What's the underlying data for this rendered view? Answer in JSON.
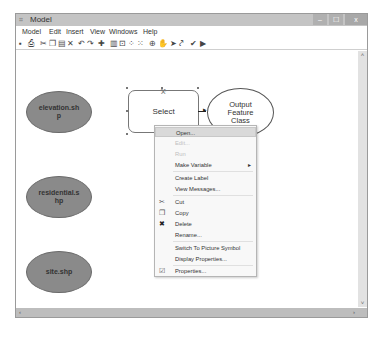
{
  "window": {
    "title": "Model",
    "app_icon": "⌗",
    "controls": {
      "minimize": "–",
      "maximize": "☐",
      "close": "x"
    }
  },
  "menubar": {
    "items": [
      {
        "label": "Model"
      },
      {
        "label": "Edit"
      },
      {
        "label": "Insert"
      },
      {
        "label": "View"
      },
      {
        "label": "Windows"
      },
      {
        "label": "Help"
      }
    ]
  },
  "toolbar": {
    "icons": [
      {
        "name": "save-icon",
        "glyph": "▪"
      },
      {
        "name": "print-icon",
        "glyph": "⎙"
      },
      {
        "name": "cut-icon",
        "glyph": "✂"
      },
      {
        "name": "copy-icon",
        "glyph": "❐"
      },
      {
        "name": "paste-icon",
        "glyph": "▤"
      },
      {
        "name": "delete-icon",
        "glyph": "✕"
      },
      {
        "name": "undo-icon",
        "glyph": "↶"
      },
      {
        "name": "redo-icon",
        "glyph": "↷"
      },
      {
        "name": "add-data-icon",
        "glyph": "✚"
      },
      {
        "name": "auto-layout-icon",
        "glyph": "▥"
      },
      {
        "name": "full-extent-icon",
        "glyph": "⊡"
      },
      {
        "name": "select-all-icon",
        "glyph": "⁘"
      },
      {
        "name": "select-elements-icon",
        "glyph": "⁙"
      },
      {
        "name": "zoom-in-icon",
        "glyph": "⊕"
      },
      {
        "name": "pan-icon",
        "glyph": "✋"
      },
      {
        "name": "select-pointer-icon",
        "glyph": "➤"
      },
      {
        "name": "add-connection-icon",
        "glyph": "⤤"
      },
      {
        "name": "validate-icon",
        "glyph": "✔"
      },
      {
        "name": "run-icon",
        "glyph": "▶"
      }
    ]
  },
  "diagram": {
    "inputs": [
      {
        "label": "elevation.sh\np"
      },
      {
        "label": "residential.s\nhp"
      },
      {
        "label": "site.shp"
      }
    ],
    "tool": {
      "label": "Select"
    },
    "output": {
      "label": "Output\nFeature\nClass"
    }
  },
  "context_menu": {
    "items": [
      {
        "label": "Open...",
        "enabled": true,
        "highlighted": true
      },
      {
        "label": "Edit...",
        "enabled": false
      },
      {
        "label": "Run",
        "enabled": false
      },
      {
        "label": "Make Variable",
        "enabled": true,
        "submenu": "▸"
      },
      {
        "label": "Create Label",
        "enabled": true
      },
      {
        "label": "View Messages...",
        "enabled": true
      },
      {
        "label": "Cut",
        "enabled": true,
        "icon": "✂"
      },
      {
        "label": "Copy",
        "enabled": true,
        "icon": "❐"
      },
      {
        "label": "Delete",
        "enabled": true,
        "icon": "✖"
      },
      {
        "label": "Rename...",
        "enabled": true
      },
      {
        "label": "Switch To Picture Symbol",
        "enabled": true
      },
      {
        "label": "Display Properties...",
        "enabled": true
      },
      {
        "label": "Properties...",
        "enabled": true,
        "icon": "☑"
      }
    ]
  },
  "scrollbars": {
    "up": "˄",
    "down": "˅",
    "left": "‹",
    "right": "›"
  }
}
